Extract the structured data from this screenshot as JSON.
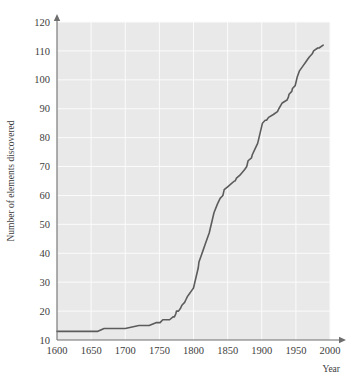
{
  "chart_data": {
    "type": "line",
    "title": "",
    "xlabel": "Year",
    "ylabel": "Number of elements discovered",
    "xlim": [
      1600,
      2000
    ],
    "ylim": [
      10,
      120
    ],
    "xticks": [
      1600,
      1650,
      1700,
      1750,
      1800,
      1850,
      1900,
      1950,
      2000
    ],
    "yticks": [
      10,
      20,
      30,
      40,
      50,
      60,
      70,
      80,
      90,
      100,
      110,
      120
    ],
    "grid": true,
    "legend": "none",
    "line_color": "#5c5c5c",
    "plot_background": "#e9e9e9",
    "gridline_color": "#fbfbfb",
    "axis_color": "#6e6e6e",
    "series": [
      {
        "name": "Cumulative elements discovered",
        "x": [
          1600,
          1620,
          1640,
          1660,
          1669,
          1680,
          1700,
          1720,
          1735,
          1745,
          1751,
          1755,
          1760,
          1765,
          1770,
          1772,
          1774,
          1775,
          1778,
          1781,
          1783,
          1787,
          1789,
          1791,
          1794,
          1797,
          1800,
          1803,
          1805,
          1807,
          1808,
          1811,
          1814,
          1817,
          1820,
          1823,
          1825,
          1827,
          1830,
          1835,
          1839,
          1843,
          1844,
          1845,
          1850,
          1855,
          1860,
          1861,
          1863,
          1868,
          1875,
          1878,
          1879,
          1880,
          1885,
          1886,
          1890,
          1894,
          1896,
          1898,
          1900,
          1901,
          1905,
          1907,
          1910,
          1917,
          1923,
          1925,
          1930,
          1937,
          1939,
          1940,
          1944,
          1945,
          1949,
          1950,
          1952,
          1955,
          1961,
          1964,
          1967,
          1970,
          1974,
          1976,
          1982,
          1984,
          1990
        ],
        "y": [
          13,
          13,
          13,
          13,
          14,
          14,
          14,
          15,
          15,
          16,
          16,
          17,
          17,
          17,
          18,
          18,
          19,
          20,
          20,
          21,
          22,
          23,
          24,
          25,
          26,
          27,
          28,
          31,
          33,
          35,
          37,
          39,
          41,
          43,
          45,
          47,
          49,
          51,
          54,
          57,
          59,
          60,
          61,
          62,
          63,
          64,
          65,
          65,
          66,
          67,
          69,
          70,
          71,
          72,
          73,
          74,
          76,
          78,
          80,
          82,
          84,
          85,
          86,
          86,
          87,
          88,
          89,
          90,
          92,
          93,
          94,
          95,
          96,
          97,
          98,
          99,
          101,
          103,
          105,
          106,
          107,
          108,
          109,
          110,
          111,
          111,
          112
        ]
      }
    ]
  },
  "axis_labels": {
    "x_title": "Year",
    "y_title": "Number of elements discovered"
  }
}
